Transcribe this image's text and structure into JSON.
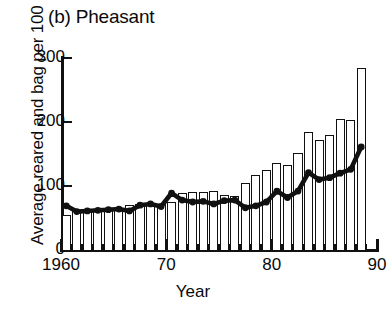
{
  "figure": {
    "panel_title": "(b) Pheasant",
    "ylabel": "Average reared and bag per 100 ha",
    "xlabel": "Year",
    "ink_color": "#111111",
    "bar_fill": "#ffffff"
  },
  "axes": {
    "y_ticks": [
      0,
      100,
      200,
      300
    ],
    "y_tick_labels": [
      "0",
      "100",
      "200",
      "300"
    ],
    "ylim": [
      0,
      300
    ],
    "x_major_ticks": [
      1960,
      1970,
      1980,
      1990
    ],
    "x_major_labels": [
      "1960",
      "70",
      "80",
      "90"
    ],
    "xlim": [
      1960,
      1990
    ],
    "x_minor_step": 1
  },
  "chart_data": {
    "type": "bar",
    "title": "(b) Pheasant",
    "xlabel": "Year",
    "ylabel": "Average reared and bag per 100 ha",
    "xlim": [
      1960,
      1990
    ],
    "ylim": [
      0,
      300
    ],
    "grid": false,
    "legend": null,
    "categories": [
      1960,
      1961,
      1962,
      1963,
      1964,
      1965,
      1966,
      1967,
      1968,
      1969,
      1970,
      1971,
      1972,
      1973,
      1974,
      1975,
      1976,
      1977,
      1978,
      1979,
      1980,
      1981,
      1982,
      1983,
      1984,
      1985,
      1986,
      1987,
      1988
    ],
    "series": [
      {
        "name": "Average reared and bag",
        "type": "bar",
        "values": [
          55,
          62,
          63,
          62,
          63,
          66,
          70,
          72,
          73,
          72,
          75,
          89,
          90,
          90,
          92,
          86,
          84,
          104,
          117,
          125,
          136,
          133,
          152,
          185,
          172,
          180,
          205,
          203,
          285
        ]
      },
      {
        "name": "Smoothed index",
        "type": "line",
        "marker": "filled-circle",
        "values": [
          69,
          60,
          61,
          62,
          63,
          64,
          61,
          70,
          72,
          68,
          89,
          78,
          75,
          76,
          72,
          77,
          78,
          66,
          69,
          75,
          92,
          82,
          92,
          121,
          110,
          113,
          120,
          126,
          161
        ]
      }
    ]
  }
}
